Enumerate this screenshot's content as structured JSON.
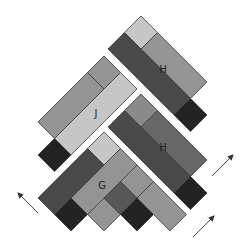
{
  "diagram": {
    "colors": {
      "light": "#c6c6c6",
      "medium": "#949494",
      "medium_alt": "#8a8a8a",
      "medium_dark": "#686868",
      "dark": "#4a4a4a",
      "dark_gray": "#575757",
      "black": "#232323",
      "stroke": "#3a3a3a",
      "arrow": "#333333"
    },
    "groups": [
      {
        "id": "H-top",
        "label": "H",
        "label_pos": [
          163,
          73
        ],
        "pieces": [
          {
            "kind": "square",
            "shade": "light",
            "points": "141,16 157.5,32.5 141,49 124.5,32.5"
          },
          {
            "kind": "bar",
            "shade": "medium",
            "points": "157.5,32.5 207,82 190.5,98.5 141,49"
          },
          {
            "kind": "bar",
            "shade": "dark",
            "points": "124.5,32.5 190.5,98.5 174,115 108,49"
          },
          {
            "kind": "square",
            "shade": "black",
            "points": "190.5,98.5 207,115 190.5,131.5 174,115"
          }
        ]
      },
      {
        "id": "J",
        "label": "J",
        "label_pos": [
          96,
          117
        ],
        "pieces": [
          {
            "kind": "square",
            "shade": "medium",
            "points": "104,56 120.5,72.5 104,89 87.5,72.5"
          },
          {
            "kind": "bar",
            "shade": "light",
            "points": "120.5,72.5 137,89 71,155 54.5,138.5"
          },
          {
            "kind": "bar",
            "shade": "medium",
            "points": "87.5,72.5 104,89 54.5,138.5 38,122"
          },
          {
            "kind": "square",
            "shade": "black",
            "points": "54.5,138.5 71,155 54.5,171.5 38,155"
          }
        ]
      },
      {
        "id": "H-middle",
        "label": "H",
        "label_pos": [
          163,
          151
        ],
        "pieces": [
          {
            "kind": "square",
            "shade": "medium_alt",
            "points": "141,94 157.5,110.5 141,127 124.5,110.5"
          },
          {
            "kind": "bar",
            "shade": "medium_dark",
            "points": "157.5,110.5 207,160 190.5,176.5 141,127"
          },
          {
            "kind": "bar",
            "shade": "dark",
            "points": "124.5,110.5 190.5,176.5 174,193 108,127"
          },
          {
            "kind": "square",
            "shade": "black",
            "points": "190.5,176.5 207,193 190.5,209.5 174,193"
          }
        ]
      },
      {
        "id": "G",
        "label": "G",
        "label_pos": [
          102,
          189
        ],
        "pieces": [
          {
            "kind": "square",
            "shade": "light",
            "points": "104,132 120.5,148.5 104,165 87.5,148.5"
          },
          {
            "kind": "bar",
            "shade": "dark",
            "points": "87.5,148.5 104,165 54.5,214.5 38,198"
          },
          {
            "kind": "bar",
            "shade": "medium",
            "points": "120.5,148.5 137,165 87.5,214.5 71,198"
          },
          {
            "kind": "square",
            "shade": "black",
            "points": "71,198 87.5,214.5 71,231 54.5,214.5"
          },
          {
            "kind": "square",
            "shade": "medium",
            "points": "104,198 120.5,214.5 104,231 87.5,214.5"
          },
          {
            "kind": "square",
            "shade": "dark_gray",
            "points": "120.5,181.5 137,198 120.5,214.5 104,198"
          },
          {
            "kind": "square",
            "shade": "medium",
            "points": "137,165 153.5,181.5 137,198 120.5,181.5"
          },
          {
            "kind": "square",
            "shade": "black",
            "points": "137,198 153.5,214.5 137,231 120.5,214.5"
          },
          {
            "kind": "bar",
            "shade": "medium",
            "points": "153.5,181.5 186.5,214.5 170,231 137,198"
          }
        ]
      }
    ],
    "arrows": [
      {
        "id": "arrow-left-up",
        "x1": 38,
        "y1": 213,
        "x2": 18,
        "y2": 193
      },
      {
        "id": "arrow-right-up-upper",
        "x1": 212,
        "y1": 176,
        "x2": 233,
        "y2": 155
      },
      {
        "id": "arrow-right-up-lower",
        "x1": 193,
        "y1": 237,
        "x2": 214,
        "y2": 216
      }
    ]
  }
}
